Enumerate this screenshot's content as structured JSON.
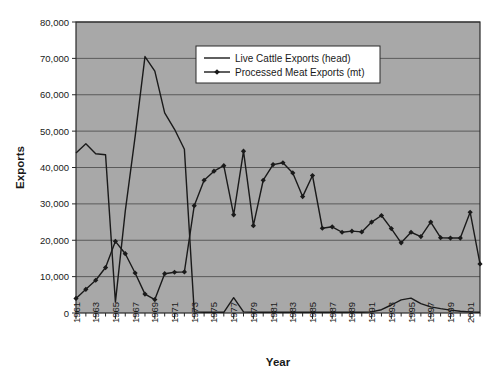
{
  "chart_data": {
    "type": "line",
    "title": "",
    "xlabel": "Year",
    "ylabel": "Exports",
    "xlim": [
      1961,
      2002
    ],
    "ylim": [
      0,
      80000
    ],
    "ytick_labels": [
      "80,000",
      "70,000",
      "60,000",
      "50,000",
      "40,000",
      "30,000",
      "20,000",
      "10,000",
      "0"
    ],
    "ytick_values": [
      80000,
      70000,
      60000,
      50000,
      40000,
      30000,
      20000,
      10000,
      0
    ],
    "xtick_labels": [
      "1961",
      "1963",
      "1965",
      "1967",
      "1969",
      "1971",
      "1973",
      "1975",
      "1977",
      "1979",
      "1981",
      "1983",
      "1985",
      "1987",
      "1989",
      "1991",
      "1993",
      "1995",
      "1997",
      "1999",
      "2001"
    ],
    "grid": true,
    "legend_position": "top-center",
    "plot_background": "#a8a8a8",
    "line_color": "#1a1a1a",
    "x": [
      1961,
      1962,
      1963,
      1964,
      1965,
      1966,
      1967,
      1968,
      1969,
      1970,
      1971,
      1972,
      1973,
      1974,
      1975,
      1976,
      1977,
      1978,
      1979,
      1980,
      1981,
      1982,
      1983,
      1984,
      1985,
      1986,
      1987,
      1988,
      1989,
      1990,
      1991,
      1992,
      1993,
      1994,
      1995,
      1996,
      1997,
      1998,
      1999,
      2000,
      2001,
      2002
    ],
    "series": [
      {
        "name": "Live Cattle Exports (head)",
        "marker": "none",
        "values": [
          44000,
          46500,
          43800,
          43500,
          3000,
          28000,
          48500,
          70500,
          66500,
          55000,
          50500,
          45000,
          300,
          200,
          200,
          200,
          4200,
          300,
          200,
          200,
          200,
          200,
          200,
          200,
          200,
          200,
          200,
          200,
          200,
          200,
          300,
          900,
          2200,
          3600,
          4100,
          2600,
          1700,
          1200,
          800,
          500,
          300,
          200
        ]
      },
      {
        "name": "Processed Meat Exports (mt)",
        "marker": "diamond",
        "values": [
          4000,
          6500,
          9000,
          12500,
          19700,
          16300,
          11000,
          5200,
          3700,
          10800,
          11200,
          11300,
          29500,
          36500,
          39000,
          40500,
          27000,
          44500,
          24000,
          36500,
          40800,
          41300,
          38500,
          32000,
          37800,
          23300,
          23700,
          22200,
          22500,
          22300,
          25000,
          26800,
          23200,
          19300,
          22200,
          21000,
          25000,
          20700,
          20600,
          20600,
          27700,
          13500
        ]
      }
    ]
  }
}
